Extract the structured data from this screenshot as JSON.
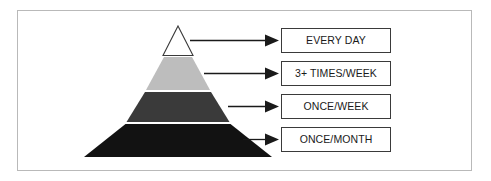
{
  "diagram": {
    "type": "pyramid",
    "border_color": "#b9b9b9",
    "background_color": "#ffffff"
  },
  "pyramid": {
    "apex_label": "pyramid-apex",
    "segments": [
      {
        "index": 0,
        "name": "segment-top",
        "fill": "#ffffff",
        "stroke": "#3a3a3a",
        "label": "EVERY DAY"
      },
      {
        "index": 1,
        "name": "segment-second",
        "fill": "#bdbdbd",
        "stroke": "none",
        "label": "3+ TIMES/WEEK"
      },
      {
        "index": 2,
        "name": "segment-third",
        "fill": "#3a3a3a",
        "stroke": "none",
        "label": "ONCE/WEEK"
      },
      {
        "index": 3,
        "name": "segment-bottom",
        "fill": "#121212",
        "stroke": "none",
        "label": "ONCE/MONTH"
      }
    ]
  },
  "labels": [
    {
      "id": "every-day",
      "text": "EVERY DAY"
    },
    {
      "id": "three-plus-times-week",
      "text": "3+ TIMES/WEEK"
    },
    {
      "id": "once-week",
      "text": "ONCE/WEEK"
    },
    {
      "id": "once-month",
      "text": "ONCE/MONTH"
    }
  ],
  "arrows": {
    "count": 4,
    "color": "#1a1a1a",
    "direction": "right"
  }
}
